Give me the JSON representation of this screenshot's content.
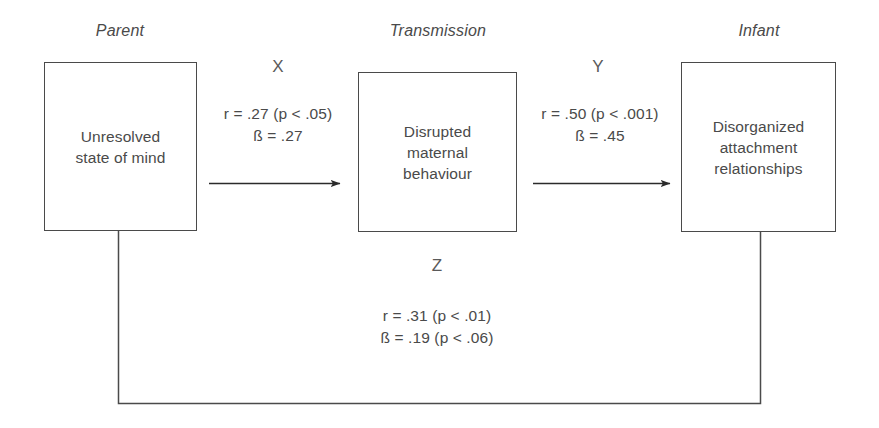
{
  "figure": {
    "groups": [
      {
        "id": "parent",
        "label": "Parent"
      },
      {
        "id": "transmission",
        "label": "Transmission"
      },
      {
        "id": "infant",
        "label": "Infant"
      }
    ],
    "nodes": [
      {
        "id": "unresolved-state-of-mind",
        "text": "Unresolved\nstate of mind"
      },
      {
        "id": "disrupted-maternal-behaviour",
        "text": "Disrupted\nmaternal\nbehaviour"
      },
      {
        "id": "disorganized-attachment-relationships",
        "text": "Disorganized\nattachment\nrelationships"
      }
    ],
    "paths": [
      {
        "id": "x",
        "letter": "X",
        "stats": "r = .27 (p < .05)\nß = .27",
        "r": ".27",
        "r_p": "p < .05",
        "beta": ".27",
        "beta_p": ""
      },
      {
        "id": "y",
        "letter": "Y",
        "stats": "r = .50 (p < .001)\nß = .45",
        "r": ".50",
        "r_p": "p < .001",
        "beta": ".45",
        "beta_p": ""
      },
      {
        "id": "z",
        "letter": "Z",
        "stats": "r = .31 (p < .01)\nß = .19 (p < .06)",
        "r": ".31",
        "r_p": "p < .01",
        "beta": ".19",
        "beta_p": "p < .06"
      }
    ],
    "colors": {
      "stroke": "#4a4a4a",
      "text": "#4a4a4a",
      "background": "#ffffff"
    }
  }
}
